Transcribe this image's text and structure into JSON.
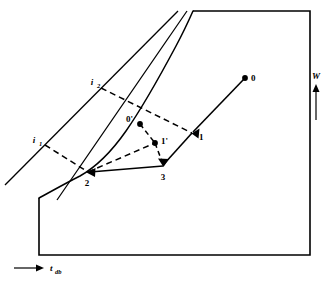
{
  "figure": {
    "type": "psychrometric-chart-diagram",
    "background_color": "#ffffff",
    "line_color": "#000000"
  },
  "axes": {
    "x_axis": {
      "label": "t",
      "subscript": "db",
      "icon": "right-arrow-icon",
      "direction": "increasing to the right"
    },
    "y_axis": {
      "label": "W",
      "icon": "up-arrow-icon",
      "direction": "increasing upward"
    }
  },
  "enthalpy_lines": [
    {
      "label": "i",
      "subscript": "1",
      "name": "enthalpy-line-i1"
    },
    {
      "label": "i",
      "subscript": "2",
      "name": "enthalpy-line-i2"
    }
  ],
  "state_points": [
    {
      "id": "p0",
      "label": "0",
      "x": 245,
      "y": 78,
      "marker": "filled-dot"
    },
    {
      "id": "p1",
      "label": "1",
      "x": 192,
      "y": 133,
      "marker": "arrowhead"
    },
    {
      "id": "p2",
      "label": "2",
      "x": 88,
      "y": 172,
      "marker": "arrowhead"
    },
    {
      "id": "p3",
      "label": "3",
      "x": 163,
      "y": 166,
      "marker": "arrowhead"
    },
    {
      "id": "p0p",
      "label": "0'",
      "x": 140,
      "y": 124,
      "marker": "filled-dot"
    },
    {
      "id": "p1p",
      "label": "1'",
      "x": 155,
      "y": 143,
      "marker": "filled-dot"
    }
  ],
  "processes": [
    {
      "from": "0",
      "to": "1",
      "style": "solid",
      "name": "process-0-to-1"
    },
    {
      "from": "1",
      "to": "3",
      "style": "solid",
      "name": "process-1-to-3"
    },
    {
      "from": "3",
      "to": "2",
      "style": "solid",
      "name": "process-3-to-2"
    },
    {
      "from": "0'",
      "to": "1'",
      "style": "dashed",
      "name": "process-0prime-to-1prime"
    },
    {
      "from": "1'",
      "to": "3",
      "style": "dashed",
      "name": "process-1prime-to-3"
    },
    {
      "from": "1'",
      "to": "2",
      "style": "dashed",
      "name": "process-1prime-to-2"
    },
    {
      "from": "i1",
      "to": "2",
      "style": "dashed",
      "name": "enthalpy-tie-i1-to-2"
    },
    {
      "from": "i2",
      "to": "1",
      "style": "dashed",
      "name": "enthalpy-tie-i2-to-1"
    }
  ],
  "curves": [
    {
      "name": "saturation-curve",
      "style": "solid"
    },
    {
      "name": "chart-boundary",
      "style": "solid"
    }
  ]
}
